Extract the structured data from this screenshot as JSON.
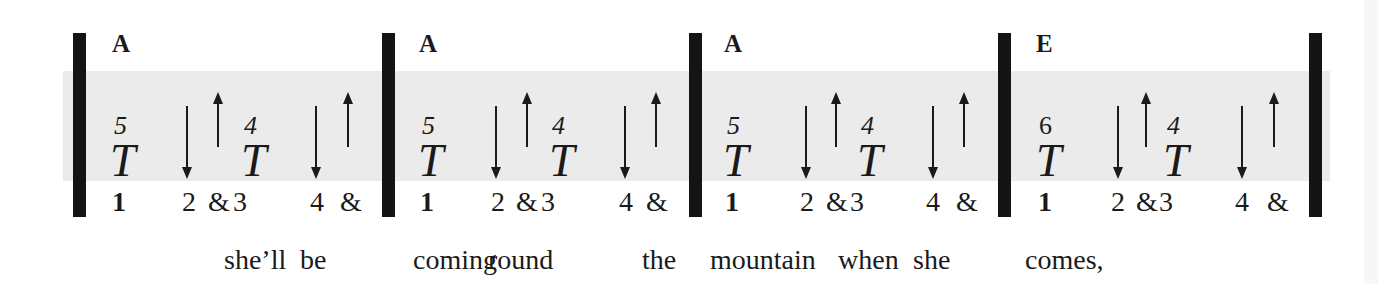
{
  "colors": {
    "band": "#ebebeb",
    "ink": "#1a1a1a",
    "bar": "#141414"
  },
  "measures": [
    {
      "chord": "A",
      "strums": [
        {
          "symbol": "T",
          "superscript": "5",
          "beat": "1",
          "type": "thumb"
        },
        {
          "symbol": "down-arrow",
          "beat": "2",
          "type": "down"
        },
        {
          "symbol": "up-arrow",
          "beat": "&",
          "type": "up"
        },
        {
          "symbol": "T",
          "superscript": "4",
          "beat": "3",
          "type": "thumb"
        },
        {
          "symbol": "down-arrow",
          "beat": "4",
          "type": "down"
        },
        {
          "symbol": "up-arrow",
          "beat": "&",
          "type": "up"
        }
      ]
    },
    {
      "chord": "A",
      "strums": [
        {
          "symbol": "T",
          "superscript": "5",
          "beat": "1",
          "type": "thumb"
        },
        {
          "symbol": "down-arrow",
          "beat": "2",
          "type": "down"
        },
        {
          "symbol": "up-arrow",
          "beat": "&",
          "type": "up"
        },
        {
          "symbol": "T",
          "superscript": "4",
          "beat": "3",
          "type": "thumb"
        },
        {
          "symbol": "down-arrow",
          "beat": "4",
          "type": "down"
        },
        {
          "symbol": "up-arrow",
          "beat": "&",
          "type": "up"
        }
      ]
    },
    {
      "chord": "A",
      "strums": [
        {
          "symbol": "T",
          "superscript": "5",
          "beat": "1",
          "type": "thumb"
        },
        {
          "symbol": "down-arrow",
          "beat": "2",
          "type": "down"
        },
        {
          "symbol": "up-arrow",
          "beat": "&",
          "type": "up"
        },
        {
          "symbol": "T",
          "superscript": "4",
          "beat": "3",
          "type": "thumb"
        },
        {
          "symbol": "down-arrow",
          "beat": "4",
          "type": "down"
        },
        {
          "symbol": "up-arrow",
          "beat": "&",
          "type": "up"
        }
      ]
    },
    {
      "chord": "E",
      "strums": [
        {
          "symbol": "T",
          "superscript": "6",
          "beat": "1",
          "type": "thumb"
        },
        {
          "symbol": "down-arrow",
          "beat": "2",
          "type": "down"
        },
        {
          "symbol": "up-arrow",
          "beat": "&",
          "type": "up"
        },
        {
          "symbol": "T",
          "superscript": "4",
          "beat": "3",
          "type": "thumb"
        },
        {
          "symbol": "down-arrow",
          "beat": "4",
          "type": "down"
        },
        {
          "symbol": "up-arrow",
          "beat": "&",
          "type": "up"
        }
      ]
    }
  ],
  "lyrics": [
    {
      "text": "she’ll",
      "x": 224
    },
    {
      "text": "be",
      "x": 300
    },
    {
      "text": "coming",
      "x": 413
    },
    {
      "text": "round",
      "x": 488
    },
    {
      "text": "the",
      "x": 642
    },
    {
      "text": "mountain",
      "x": 710
    },
    {
      "text": "when",
      "x": 838
    },
    {
      "text": "she",
      "x": 913
    },
    {
      "text": "comes,",
      "x": 1025
    }
  ]
}
